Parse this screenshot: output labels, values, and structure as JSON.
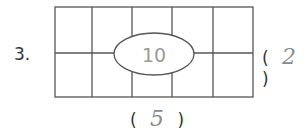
{
  "question": {
    "number": "3.",
    "grid": {
      "columns": 5,
      "rows": 2
    },
    "center_label": "10",
    "rows_answer": "2",
    "columns_answer": "5",
    "open_paren": "(",
    "close_paren": ")"
  }
}
